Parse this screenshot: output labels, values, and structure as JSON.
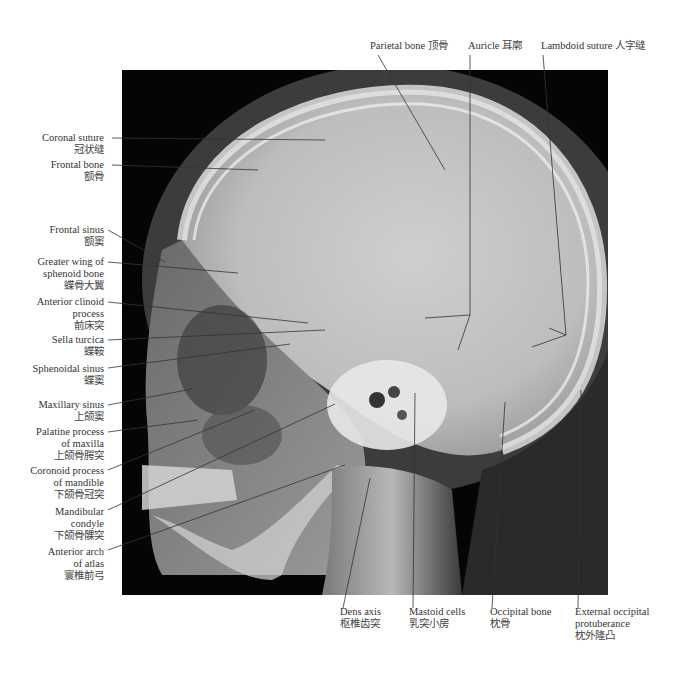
{
  "figure": {
    "colors": {
      "background": "#ffffff",
      "film": "#050505",
      "bone": "#d8d8d8",
      "leader_line": "#333333"
    }
  },
  "labels": {
    "top": [
      {
        "id": "parietal-bone",
        "en": "Parietal bone",
        "zh": "顶骨"
      },
      {
        "id": "auricle",
        "en": "Auricle",
        "zh": "耳廓"
      },
      {
        "id": "lambdoid-suture",
        "en": "Lambdoid suture",
        "zh": "人字缝"
      }
    ],
    "left": [
      {
        "id": "coronal-suture",
        "en": [
          "Coronal suture"
        ],
        "zh": "冠状缝"
      },
      {
        "id": "frontal-bone",
        "en": [
          "Frontal bone"
        ],
        "zh": "额骨"
      },
      {
        "id": "frontal-sinus",
        "en": [
          "Frontal sinus"
        ],
        "zh": "额窦"
      },
      {
        "id": "greater-wing-sphenoid",
        "en": [
          "Greater wing of",
          "sphenoid bone"
        ],
        "zh": "蝶骨大翼"
      },
      {
        "id": "anterior-clinoid-process",
        "en": [
          "Anterior clinoid",
          "process"
        ],
        "zh": "前床突"
      },
      {
        "id": "sella-turcica",
        "en": [
          "Sella turcica"
        ],
        "zh": "蝶鞍"
      },
      {
        "id": "sphenoidal-sinus",
        "en": [
          "Sphenoidal sinus"
        ],
        "zh": "蝶窦"
      },
      {
        "id": "maxillary-sinus",
        "en": [
          "Maxillary sinus"
        ],
        "zh": "上颌窦"
      },
      {
        "id": "palatine-process",
        "en": [
          "Palatine process",
          "of maxilla"
        ],
        "zh": "上颌骨腭突"
      },
      {
        "id": "coronoid-process",
        "en": [
          "Coronoid process",
          "of mandible"
        ],
        "zh": "下颌骨冠突"
      },
      {
        "id": "mandibular-condyle",
        "en": [
          "Mandibular",
          "condyle"
        ],
        "zh": "下颌骨髁突"
      },
      {
        "id": "anterior-arch-atlas",
        "en": [
          "Anterior arch",
          "of atlas"
        ],
        "zh": "寰椎前弓"
      }
    ],
    "bottom": [
      {
        "id": "dens-axis",
        "en": [
          "Dens axis"
        ],
        "zh": "枢椎齿突"
      },
      {
        "id": "mastoid-cells",
        "en": [
          "Mastoid cells"
        ],
        "zh": "乳突小房"
      },
      {
        "id": "occipital-bone",
        "en": [
          "Occipital bone"
        ],
        "zh": "枕骨"
      },
      {
        "id": "external-occipital-protuberance",
        "en": [
          "External occipital",
          "protuberance"
        ],
        "zh": "枕外隆凸"
      }
    ]
  }
}
